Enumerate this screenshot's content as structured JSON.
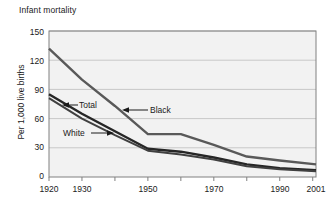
{
  "chart_data": {
    "type": "line",
    "title": "Infant mortality",
    "xlabel": "",
    "ylabel": "Per 1,000 live births",
    "xlim": [
      1920,
      2001
    ],
    "ylim": [
      0,
      150
    ],
    "grid": true,
    "legend": "inline-annotations",
    "x_tick_labels": [
      "1920",
      "1930",
      "1950",
      "1970",
      "1990",
      "2001"
    ],
    "x_tick_values": [
      1920,
      1930,
      1950,
      1970,
      1990,
      2001
    ],
    "y_tick_labels": [
      "0",
      "30",
      "60",
      "90",
      "120",
      "150"
    ],
    "y_tick_values": [
      0,
      30,
      60,
      90,
      120,
      150
    ],
    "x": [
      1920,
      1930,
      1940,
      1950,
      1960,
      1970,
      1980,
      1990,
      2001
    ],
    "series": [
      {
        "name": "Black",
        "values": [
          132,
          100,
          73,
          44,
          44,
          33,
          21,
          17,
          13
        ]
      },
      {
        "name": "Total",
        "values": [
          85,
          65,
          47,
          29,
          26,
          20,
          13,
          9,
          7
        ]
      },
      {
        "name": "White",
        "values": [
          81,
          60,
          43,
          27,
          23,
          18,
          11,
          8,
          6
        ]
      }
    ],
    "annotations": [
      {
        "label": "Total",
        "arrow": "left"
      },
      {
        "label": "Black",
        "arrow": "left"
      },
      {
        "label": "White",
        "arrow": "right"
      }
    ]
  },
  "colors": {
    "plot_background": "#f2f2f2",
    "plot_border": "#808080",
    "gridline": "#c8c8c8",
    "line_black": "#595959",
    "line_total": "#262626",
    "line_white": "#404040",
    "text": "#1a1a1a"
  }
}
